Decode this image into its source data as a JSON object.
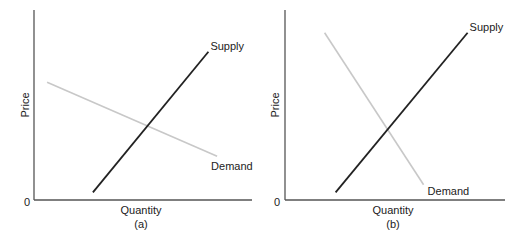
{
  "chart_data": [
    {
      "type": "line",
      "panel_label": "(a)",
      "title": "",
      "xlabel": "Quantity",
      "ylabel": "Price",
      "origin_label": "0",
      "xlim": [
        0,
        10
      ],
      "ylim": [
        0,
        10
      ],
      "grid": false,
      "series": [
        {
          "name": "Supply",
          "color": "#222222",
          "points": [
            [
              2.7,
              0.4
            ],
            [
              8.0,
              7.8
            ]
          ]
        },
        {
          "name": "Demand",
          "color": "#c8c8c8",
          "points": [
            [
              0.6,
              6.2
            ],
            [
              8.4,
              2.3
            ]
          ]
        }
      ]
    },
    {
      "type": "line",
      "panel_label": "(b)",
      "title": "",
      "xlabel": "Quantity",
      "ylabel": "Price",
      "origin_label": "0",
      "xlim": [
        0,
        10
      ],
      "ylim": [
        0,
        10
      ],
      "grid": false,
      "series": [
        {
          "name": "Supply",
          "color": "#222222",
          "points": [
            [
              2.3,
              0.4
            ],
            [
              8.3,
              8.8
            ]
          ]
        },
        {
          "name": "Demand",
          "color": "#c8c8c8",
          "points": [
            [
              1.8,
              8.8
            ],
            [
              6.3,
              0.8
            ]
          ]
        }
      ]
    }
  ]
}
